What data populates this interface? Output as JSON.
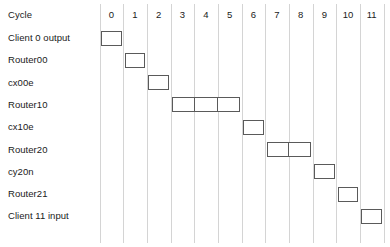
{
  "chart_data": {
    "type": "table",
    "title": "",
    "xlabel": "",
    "ylabel": "",
    "header_label": "Cycle",
    "categories": [
      "0",
      "1",
      "2",
      "3",
      "4",
      "5",
      "6",
      "7",
      "8",
      "9",
      "10",
      "11"
    ],
    "axis_range": [
      0,
      11
    ],
    "grid": true,
    "legend": "none",
    "bar_color": "#ffffff",
    "bar_border_color": "#5a5a5a",
    "gridline_color": "#d4d4d4",
    "text_color": "#1a1a1a",
    "rows": [
      {
        "label": "Client 0 output",
        "start": 0,
        "span": 1,
        "cells": 1
      },
      {
        "label": "Router00",
        "start": 1,
        "span": 1,
        "cells": 1
      },
      {
        "label": "cx00e",
        "start": 2,
        "span": 1,
        "cells": 1
      },
      {
        "label": "Router10",
        "start": 3,
        "span": 3,
        "cells": 3
      },
      {
        "label": "cx10e",
        "start": 6,
        "span": 1,
        "cells": 1
      },
      {
        "label": "Router20",
        "start": 7,
        "span": 2,
        "cells": 2
      },
      {
        "label": "cy20n",
        "start": 9,
        "span": 1,
        "cells": 1
      },
      {
        "label": "Router21",
        "start": 10,
        "span": 1,
        "cells": 1
      },
      {
        "label": "Client 11 input",
        "start": 11,
        "span": 1,
        "cells": 1
      }
    ]
  }
}
